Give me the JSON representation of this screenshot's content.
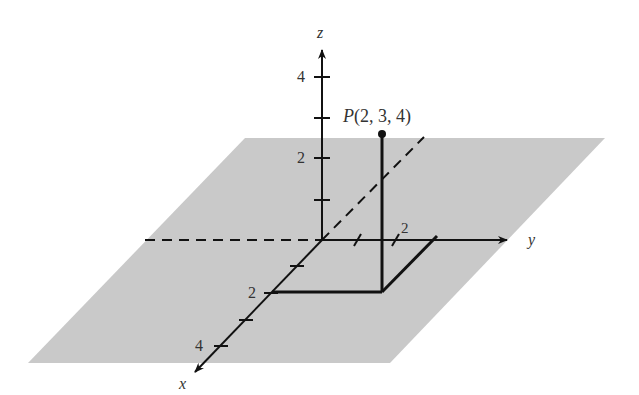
{
  "diagram": {
    "type": "3d-coordinate-system",
    "plane_color": "#c9c9c9",
    "line_color": "#111111",
    "axes": {
      "x": {
        "label": "x",
        "tick_labels": [
          "2",
          "4"
        ]
      },
      "y": {
        "label": "y",
        "tick_labels": [
          "2"
        ]
      },
      "z": {
        "label": "z",
        "tick_labels": [
          "4",
          "2"
        ]
      }
    },
    "point": {
      "label": "P(2, 3, 4)",
      "coords": [
        2,
        3,
        4
      ]
    }
  }
}
